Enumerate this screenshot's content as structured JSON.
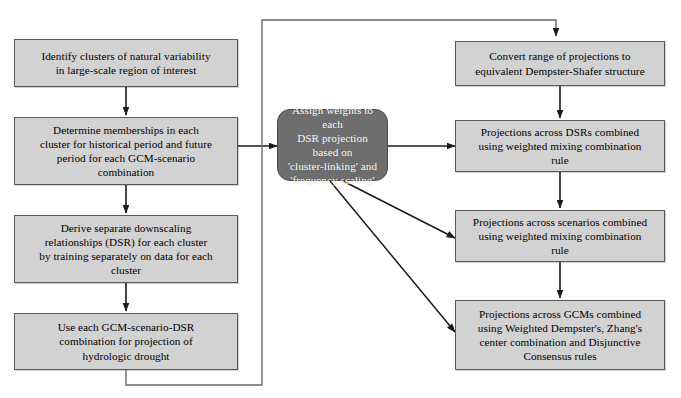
{
  "diagram": {
    "background_color": "#ffffff",
    "node_fill_color": "#d2d2d2",
    "node_border_color": "#5a5a5a",
    "emphasis_fill_color": "#6e6e6e",
    "emphasis_text_color": "#ffffff",
    "edge_color": "#1a1a1a",
    "nodes": [
      {
        "id": "identify-clusters",
        "label": "Identify clusters of natural variability\nin large-scale region of interest",
        "column": "left",
        "style": "process"
      },
      {
        "id": "determine-memberships",
        "label": "Determine memberships in each\ncluster for historical period and future\nperiod for each GCM-scenario\ncombination",
        "column": "left",
        "style": "process"
      },
      {
        "id": "derive-downscaling",
        "label": "Derive separate downscaling\nrelationships (DSR) for each cluster\nby training separately on data for each\ncluster",
        "column": "left",
        "style": "process"
      },
      {
        "id": "use-combination-projection",
        "label": "Use each GCM-scenario-DSR\ncombination for projection of\nhydrologic drought",
        "column": "left",
        "style": "process"
      },
      {
        "id": "assign-weights",
        "label": "Assign weights to each\nDSR projection based on\n'cluster-linking' and\n'frequency scaling'",
        "column": "center",
        "style": "emphasis"
      },
      {
        "id": "convert-dempster-shafer",
        "label": "Convert range of projections to\nequivalent Dempster-Shafer structure",
        "column": "right",
        "style": "process"
      },
      {
        "id": "combine-dsrs",
        "label": "Projections across DSRs combined\nusing weighted mixing combination\nrule",
        "column": "right",
        "style": "process"
      },
      {
        "id": "combine-scenarios",
        "label": "Projections across scenarios combined\nusing weighted mixing combination\nrule",
        "column": "right",
        "style": "process"
      },
      {
        "id": "combine-gcms",
        "label": "Projections across GCMs combined\nusing Weighted Dempster's, Zhang's\ncenter combination and Disjunctive\nConsensus rules",
        "column": "right",
        "style": "process"
      }
    ],
    "edges": [
      {
        "from": "identify-clusters",
        "to": "determine-memberships",
        "type": "straight-down",
        "arrow": true
      },
      {
        "from": "determine-memberships",
        "to": "derive-downscaling",
        "type": "straight-down",
        "arrow": true
      },
      {
        "from": "derive-downscaling",
        "to": "use-combination-projection",
        "type": "straight-down",
        "arrow": true
      },
      {
        "from": "determine-memberships",
        "to": "assign-weights",
        "type": "right",
        "arrow": true
      },
      {
        "from": "assign-weights",
        "to": "combine-dsrs",
        "type": "right",
        "arrow": true
      },
      {
        "from": "assign-weights",
        "to": "combine-scenarios",
        "type": "diagonal",
        "arrow": true
      },
      {
        "from": "assign-weights",
        "to": "combine-gcms",
        "type": "diagonal",
        "arrow": true
      },
      {
        "from": "convert-dempster-shafer",
        "to": "combine-dsrs",
        "type": "straight-down",
        "arrow": true
      },
      {
        "from": "combine-dsrs",
        "to": "combine-scenarios",
        "type": "straight-down",
        "arrow": true
      },
      {
        "from": "combine-scenarios",
        "to": "combine-gcms",
        "type": "straight-down",
        "arrow": true
      },
      {
        "from": "use-combination-projection",
        "to": "convert-dempster-shafer",
        "type": "feedback-loop",
        "arrow": true
      }
    ]
  }
}
